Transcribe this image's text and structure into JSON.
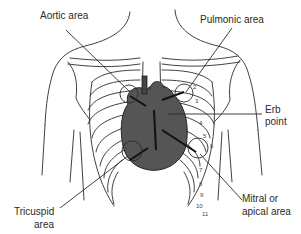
{
  "figure": {
    "labels": {
      "aortic": "Aortic area",
      "pulmonic": "Pulmonic area",
      "erb_line1": "Erb",
      "erb_line2": "point",
      "tricuspid_line1": "Tricuspid",
      "tricuspid_line2": "area",
      "mitral_line1": "Mitral or",
      "mitral_line2": "apical area"
    },
    "rib_numbers": [
      "2",
      "3",
      "4",
      "5",
      "6",
      "7",
      "8",
      "9",
      "10",
      "11"
    ],
    "colors": {
      "line": "#2b2b2b",
      "heart_fill": "#555555",
      "background": "#ffffff"
    }
  }
}
